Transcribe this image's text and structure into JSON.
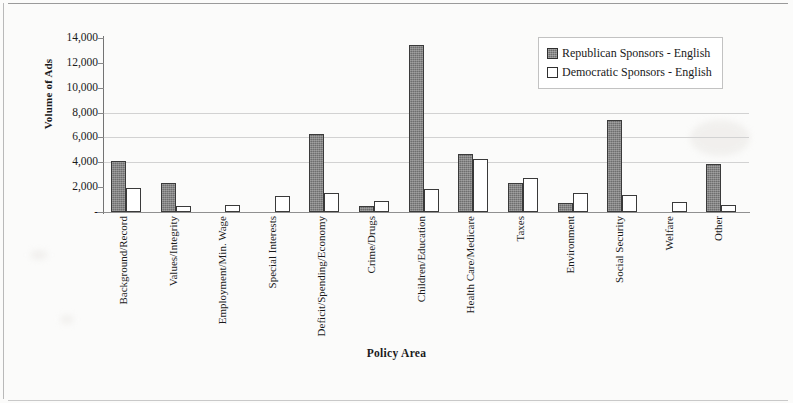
{
  "chart_data": {
    "type": "bar",
    "title": "",
    "xlabel": "Policy Area",
    "ylabel": "Volume of Ads",
    "ylim": [
      0,
      14000
    ],
    "ytick_values": [
      0,
      2000,
      4000,
      6000,
      8000,
      10000,
      12000,
      14000
    ],
    "ytick_labels": [
      "-",
      "2,000",
      "4,000",
      "6,000",
      "8,000",
      "10,000",
      "12,000",
      "14,000"
    ],
    "grid": "horizontal-light",
    "legend_position": "top-right",
    "categories": [
      "Background/Record",
      "Values/Integrity",
      "Employment/Min. Wage",
      "Special Interests",
      "Deficit/Spending/Economy",
      "Crime/Drugs",
      "Children/Education",
      "Health Care/Medicare",
      "Taxes",
      "Environment",
      "Social Security",
      "Welfare",
      "Other"
    ],
    "series": [
      {
        "name": "Republican Sponsors - English",
        "color": "#6e6e6e",
        "values": [
          4100,
          2350,
          0,
          0,
          6300,
          500,
          13400,
          4700,
          2350,
          700,
          7400,
          0,
          3900
        ]
      },
      {
        "name": "Democratic Sponsors - English",
        "color": "#ffffff",
        "values": [
          1900,
          500,
          550,
          1250,
          1550,
          900,
          1850,
          4250,
          2750,
          1500,
          1400,
          800,
          600
        ]
      }
    ]
  },
  "legend": {
    "items": [
      {
        "label": "Republican Sponsors - English",
        "swatch": "filled-gray-square"
      },
      {
        "label": "Democratic Sponsors - English",
        "swatch": "empty-white-square"
      }
    ]
  },
  "axes": {
    "y_title": "Volume of Ads",
    "x_title": "Policy Area"
  }
}
